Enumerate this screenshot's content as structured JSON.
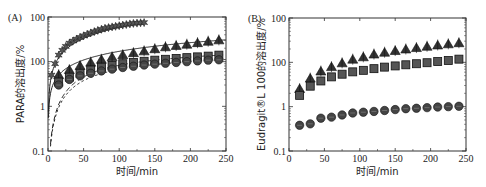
{
  "chart_data": [
    {
      "panel_label": "(A)",
      "type": "scatter",
      "yscale": "log",
      "xlabel": "时间/min",
      "ylabel": "PARA的溶出度/%",
      "xlim": [
        0,
        250
      ],
      "ylim": [
        0.1,
        100
      ],
      "xticks": [
        "0",
        "50",
        "100",
        "150",
        "200",
        "250"
      ],
      "yticks": [
        "0.1",
        "1",
        "100",
        "100"
      ],
      "grid": false,
      "series": [
        {
          "name": "stars",
          "marker": "star",
          "fit_line": "solid",
          "x": [
            5,
            10,
            15,
            20,
            25,
            30,
            35,
            40,
            45,
            50,
            55,
            60,
            65,
            70,
            75,
            80,
            85,
            90,
            95,
            100,
            105,
            110,
            115,
            120,
            125,
            130,
            135
          ],
          "values": [
            5,
            9,
            14,
            18,
            22,
            26,
            29,
            32,
            35,
            38,
            41,
            44,
            47,
            50,
            53,
            56,
            58,
            60,
            62,
            64,
            66,
            68,
            70,
            72,
            73,
            74,
            75
          ]
        },
        {
          "name": "triangles",
          "marker": "triangle",
          "fit_line": "solid",
          "x": [
            15,
            30,
            45,
            60,
            75,
            90,
            105,
            120,
            135,
            150,
            165,
            180,
            195,
            210,
            225,
            240
          ],
          "values": [
            5,
            6.5,
            8,
            9.5,
            11,
            12.5,
            14,
            15.5,
            17,
            19,
            21,
            22.5,
            24,
            26,
            28,
            30
          ]
        },
        {
          "name": "squares",
          "marker": "square",
          "fit_line": "dashed",
          "x": [
            15,
            30,
            45,
            60,
            75,
            90,
            105,
            120,
            135,
            150,
            165,
            180,
            195,
            210,
            225,
            240
          ],
          "values": [
            3.5,
            4.5,
            5.5,
            6.5,
            7.5,
            8.2,
            9,
            9.6,
            10.2,
            10.8,
            11.3,
            11.8,
            12.3,
            12.8,
            13.3,
            14
          ]
        },
        {
          "name": "circles",
          "marker": "circle",
          "fit_line": "dotted",
          "x": [
            15,
            30,
            45,
            60,
            75,
            90,
            105,
            120,
            135,
            150,
            165,
            180,
            195,
            210,
            225,
            240
          ],
          "values": [
            3,
            4,
            4.8,
            5.5,
            6.2,
            6.8,
            7.4,
            7.9,
            8.4,
            8.8,
            9.2,
            9.6,
            10,
            10.4,
            10.8,
            11
          ]
        }
      ]
    },
    {
      "panel_label": "(B)",
      "type": "scatter",
      "yscale": "log",
      "xlabel": "时间/min",
      "ylabel": "Eudragit®L 100的溶出度/%",
      "xlim": [
        0,
        250
      ],
      "ylim": [
        0.1,
        100
      ],
      "xticks": [
        "0",
        "50",
        "100",
        "150",
        "200",
        "250"
      ],
      "yticks": [
        "0.1",
        "1",
        "100",
        "100"
      ],
      "grid": false,
      "series": [
        {
          "name": "triangles",
          "marker": "triangle",
          "x": [
            15,
            30,
            45,
            60,
            75,
            90,
            105,
            120,
            135,
            150,
            165,
            180,
            195,
            210,
            225,
            240
          ],
          "values": [
            2.5,
            4.3,
            6.2,
            7.8,
            9.5,
            11.5,
            13,
            15,
            16.5,
            18,
            19.5,
            21,
            22.5,
            24,
            25.5,
            27
          ]
        },
        {
          "name": "squares",
          "marker": "square",
          "x": [
            15,
            30,
            45,
            60,
            75,
            90,
            105,
            120,
            135,
            150,
            165,
            180,
            195,
            210,
            225,
            240
          ],
          "values": [
            1.8,
            2.9,
            3.8,
            4.7,
            5.4,
            6.1,
            6.6,
            7.2,
            7.8,
            8.3,
            8.8,
            9.3,
            9.8,
            10.4,
            11,
            11.8
          ]
        },
        {
          "name": "circles",
          "marker": "circle",
          "x": [
            15,
            30,
            45,
            60,
            75,
            90,
            105,
            120,
            135,
            150,
            165,
            180,
            195,
            210,
            225,
            240
          ],
          "values": [
            0.38,
            0.41,
            0.55,
            0.58,
            0.65,
            0.72,
            0.75,
            0.78,
            0.82,
            0.86,
            0.9,
            0.92,
            0.95,
            0.98,
            1.0,
            1.02
          ]
        }
      ]
    }
  ]
}
